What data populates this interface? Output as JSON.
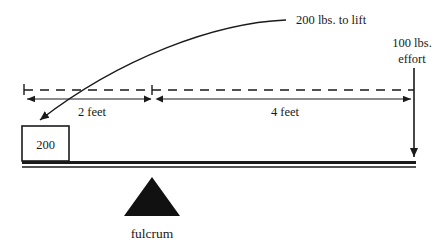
{
  "diagram": {
    "colors": {
      "ink": "#1a1a1a",
      "background": "#ffffff",
      "fulcrum_fill": "#111111"
    },
    "load_callout": {
      "text": "200 lbs. to lift",
      "icon": "curved-arrow-icon"
    },
    "effort": {
      "line1": "100 lbs.",
      "line2": "effort",
      "icon": "down-arrow-icon"
    },
    "dimensions": [
      {
        "name": "load-arm",
        "label": "2 feet",
        "value": 2,
        "unit": "feet"
      },
      {
        "name": "effort-arm",
        "label": "4 feet",
        "value": 4,
        "unit": "feet"
      }
    ],
    "load_box": {
      "label": "200",
      "unit": "lbs"
    },
    "fulcrum": {
      "label": "fulcrum",
      "icon": "triangle-icon"
    },
    "beam": {
      "name": "lever-beam"
    },
    "reference_line": {
      "name": "dashed-baseline",
      "style": "dashed"
    }
  }
}
